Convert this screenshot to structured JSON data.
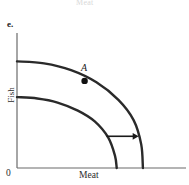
{
  "figure": {
    "part_label": "e.",
    "cut_off_text_above": "Meat",
    "origin_label": "0",
    "point_a_label": "A"
  },
  "axes": {
    "x_label": "Meat",
    "y_label": "Fish",
    "x_origin_px": 17,
    "y_origin_px": 168,
    "x_end_px": 186,
    "y_top_px": 33,
    "axis_color": "#6b6b6b"
  },
  "chart_data": {
    "type": "line",
    "title": "",
    "xlabel": "Meat",
    "ylabel": "Fish",
    "grid": false,
    "legend": null,
    "axis_ticks": {
      "x": [],
      "y": []
    },
    "annotations": [
      {
        "name": "point-a",
        "label": "A",
        "x": 0.4,
        "y": 0.645,
        "marker": "filled-circle"
      },
      {
        "name": "shift-arrow",
        "label": "",
        "from_x": 0.53,
        "from_y": 0.235,
        "to_x": 0.72,
        "to_y": 0.235,
        "style": "right-arrow"
      }
    ],
    "series": [
      {
        "name": "original-ppf",
        "description": "inner production possibilities frontier",
        "stroke": "#2a2a2a",
        "width": 2.4,
        "points": [
          [
            0.0,
            0.525
          ],
          [
            0.12,
            0.515
          ],
          [
            0.24,
            0.485
          ],
          [
            0.36,
            0.425
          ],
          [
            0.46,
            0.345
          ],
          [
            0.54,
            0.225
          ],
          [
            0.58,
            0.09
          ],
          [
            0.59,
            0.0
          ]
        ]
      },
      {
        "name": "shifted-ppf",
        "description": "outer production possibilities frontier after growth",
        "stroke": "#2a2a2a",
        "width": 2.4,
        "points": [
          [
            0.0,
            0.79
          ],
          [
            0.16,
            0.775
          ],
          [
            0.32,
            0.725
          ],
          [
            0.47,
            0.635
          ],
          [
            0.6,
            0.505
          ],
          [
            0.69,
            0.355
          ],
          [
            0.735,
            0.175
          ],
          [
            0.745,
            0.0
          ]
        ]
      }
    ],
    "xlim": [
      0,
      1
    ],
    "ylim": [
      0,
      1
    ]
  }
}
